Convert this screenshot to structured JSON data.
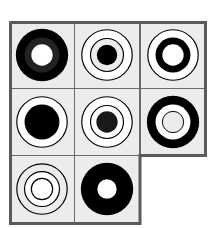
{
  "puzzle": {
    "type": "visual-matrix-puzzle",
    "rows": 3,
    "cols": 3,
    "missing_cell": {
      "row": 2,
      "col": 2
    },
    "colors": {
      "cell_background": "#ececec",
      "grid_line": "#6a6a6a",
      "outer_border": "#5a5a5a",
      "ink": "#000000",
      "paper": "#ffffff"
    },
    "cells": [
      {
        "row": 0,
        "col": 0,
        "description": "thick black ring (dark gray inner band) with white center"
      },
      {
        "row": 0,
        "col": 1,
        "description": "two thin concentric rings around a black dot"
      },
      {
        "row": 0,
        "col": 2,
        "description": "thin outer ring around a thick black ring with white center"
      },
      {
        "row": 1,
        "col": 0,
        "description": "thin outer ring around a large black disc"
      },
      {
        "row": 1,
        "col": 1,
        "description": "two thin concentric rings around a dark dot"
      },
      {
        "row": 1,
        "col": 2,
        "description": "thick black ring around a thin inner ring with gray center"
      },
      {
        "row": 2,
        "col": 0,
        "description": "three thin concentric rings with white center"
      },
      {
        "row": 2,
        "col": 1,
        "description": "large black disc with small white center"
      }
    ]
  }
}
